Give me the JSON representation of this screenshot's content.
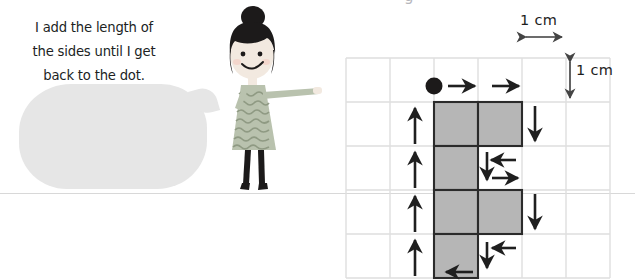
{
  "page": {
    "top_cut_glyph": "g",
    "rule_color": "#d8d8d8",
    "background": "#ffffff"
  },
  "speech_bubble": {
    "name": "speech-bubble",
    "fill_color": "#e6e6e6",
    "text_color": "#211f1f",
    "lines": [
      "I add the length of",
      "the sides until I get",
      "back to the dot."
    ],
    "full_text": "I add the length of the sides until I get back to the dot."
  },
  "character": {
    "name": "girl-illustration",
    "hair_color": "#1c1a1a",
    "skin_color": "#f0e6dd",
    "dress_color": "#b9c2ae",
    "dress_pattern_color": "#8f9a82",
    "legs_color": "#1c1a1a",
    "description": "Girl with hair bun pointing to the right"
  },
  "diagram": {
    "name": "perimeter-grid-diagram",
    "grid": {
      "columns": 6,
      "rows": 5,
      "cell_size_px": 44,
      "line_color": "#dcdcdc",
      "origin_x": 10,
      "origin_y": 58
    },
    "scale_labels": [
      {
        "text": "1 cm",
        "orientation": "horizontal",
        "name": "horizontal-scale-label"
      },
      {
        "text": "1 cm",
        "orientation": "vertical",
        "name": "vertical-scale-label"
      }
    ],
    "start_dot": {
      "name": "start-dot",
      "color": "#1c1a1a",
      "col": 2,
      "row": 0
    },
    "shape": {
      "fill_color": "#b5b5b5",
      "stroke_color": "#2a2a2a",
      "cells": [
        {
          "col": 2,
          "row": 1
        },
        {
          "col": 3,
          "row": 1
        },
        {
          "col": 2,
          "row": 2
        },
        {
          "col": 2,
          "row": 3
        },
        {
          "col": 3,
          "row": 3
        },
        {
          "col": 2,
          "row": 4
        }
      ]
    },
    "arrows": {
      "color": "#1f1f1f",
      "items": [
        {
          "name": "arrow-right-top-1",
          "direction": "right"
        },
        {
          "name": "arrow-right-top-2",
          "direction": "right"
        },
        {
          "name": "arrow-down-right-1",
          "direction": "down"
        },
        {
          "name": "arrow-left-notch-1",
          "direction": "left"
        },
        {
          "name": "arrow-down-notch-1",
          "direction": "down"
        },
        {
          "name": "arrow-right-notch-1",
          "direction": "right"
        },
        {
          "name": "arrow-down-right-2",
          "direction": "down"
        },
        {
          "name": "arrow-left-notch-2",
          "direction": "left"
        },
        {
          "name": "arrow-down-notch-2",
          "direction": "down"
        },
        {
          "name": "arrow-left-bottom",
          "direction": "left"
        },
        {
          "name": "arrow-up-1",
          "direction": "up"
        },
        {
          "name": "arrow-up-2",
          "direction": "up"
        },
        {
          "name": "arrow-up-3",
          "direction": "up"
        },
        {
          "name": "arrow-up-4",
          "direction": "up"
        }
      ]
    }
  }
}
